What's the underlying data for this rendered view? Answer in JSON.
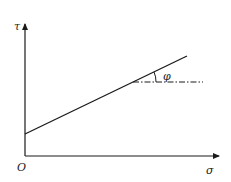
{
  "diagram": {
    "type": "mohr-coulomb-failure-envelope",
    "axes": {
      "x_label": "σ",
      "y_label": "τ",
      "origin_label": "O"
    },
    "angle_label": "φ",
    "colors": {
      "line": "#1a1a1a",
      "background": "#ffffff"
    }
  }
}
